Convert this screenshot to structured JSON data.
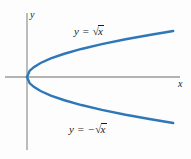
{
  "figure": {
    "background_color": "#fdfdfd"
  },
  "axes": {
    "color": "#9a9a9a",
    "x_axis": {
      "label": "x",
      "y_position": 77,
      "x_start": 5,
      "x_end": 180
    },
    "y_axis": {
      "label": "y",
      "x_position": 27,
      "y_start": 13,
      "y_end": 150
    },
    "origin": {
      "x": 27,
      "y": 77
    }
  },
  "curves": {
    "color": "#2E77B8",
    "stroke_width": 2.4,
    "upper": {
      "equation_parts": {
        "lhs": "y",
        "equals": "=",
        "radical": "√",
        "radicand": "x",
        "sign": ""
      },
      "label_text": "y = √x"
    },
    "lower": {
      "equation_parts": {
        "lhs": "y",
        "equals": "=",
        "radical": "√",
        "radicand": "x",
        "sign": "−"
      },
      "label_text": "y = −√x"
    }
  },
  "chart_data": {
    "type": "line",
    "title": "",
    "xlabel": "x",
    "ylabel": "y",
    "grid": false,
    "legend": "inline-annotations",
    "xlim": [
      -0.3,
      9.0
    ],
    "ylim": [
      -3.0,
      3.0
    ],
    "series": [
      {
        "name": "y = √x",
        "color": "#2E77B8",
        "x": [
          0,
          0.15,
          0.4,
          0.8,
          1.4,
          2.2,
          3.2,
          4.4,
          5.8,
          7.2,
          8.6
        ],
        "y": [
          0,
          0.387,
          0.632,
          0.894,
          1.183,
          1.483,
          1.789,
          2.098,
          2.408,
          2.683,
          2.933
        ]
      },
      {
        "name": "y = −√x",
        "color": "#2E77B8",
        "x": [
          0,
          0.15,
          0.4,
          0.8,
          1.4,
          2.2,
          3.2,
          4.4,
          5.8,
          7.2,
          8.6
        ],
        "y": [
          0,
          -0.387,
          -0.632,
          -0.894,
          -1.183,
          -1.483,
          -1.789,
          -2.098,
          -2.408,
          -2.683,
          -2.933
        ]
      }
    ],
    "annotations": [
      {
        "text": "y = √x",
        "x": 3.0,
        "y": 2.05
      },
      {
        "text": "y = −√x",
        "x": 2.8,
        "y": -1.85
      }
    ]
  }
}
